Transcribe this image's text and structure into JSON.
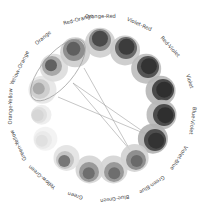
{
  "diagram": {
    "center": [
      102,
      108
    ],
    "label_radius": 90,
    "nodes": [
      {
        "label": "Orange-Red",
        "x": 100,
        "y": 40,
        "r_outer": 15,
        "r_mid": 11,
        "r_inner": 8,
        "outer": "#cfcfcf",
        "mid": "#8a8a8a",
        "inner": "#4a4a4a",
        "angle": -91
      },
      {
        "label": "Violet-Red",
        "x": 126,
        "y": 48,
        "r_outer": 15,
        "r_mid": 11,
        "r_inner": 8,
        "outer": "#c9c9c9",
        "mid": "#6a6a6a",
        "inner": "#3c3c3c",
        "angle": -66
      },
      {
        "label": "Red-Violet",
        "x": 148,
        "y": 67,
        "r_outer": 15,
        "r_mid": 11,
        "r_inner": 8,
        "outer": "#bdbdbd",
        "mid": "#555555",
        "inner": "#333333",
        "angle": -42
      },
      {
        "label": "Violet",
        "x": 163,
        "y": 90,
        "r_outer": 15,
        "r_mid": 11,
        "r_inner": 8,
        "outer": "#b5b5b5",
        "mid": "#4a4a4a",
        "inner": "#2f2f2f",
        "angle": -17
      },
      {
        "label": "Blue-Violet",
        "x": 164,
        "y": 115,
        "r_outer": 15,
        "r_mid": 11,
        "r_inner": 8,
        "outer": "#b8b8b8",
        "mid": "#4c4c4c",
        "inner": "#2f2f2f",
        "angle": 8
      },
      {
        "label": "Violet-Blue",
        "x": 155,
        "y": 140,
        "r_outer": 15,
        "r_mid": 11,
        "r_inner": 8,
        "outer": "#b0b0b0",
        "mid": "#4d4d4d",
        "inner": "#333333",
        "angle": 33
      },
      {
        "label": "Green-Blue",
        "x": 136,
        "y": 160,
        "r_outer": 14,
        "r_mid": 10,
        "r_inner": 6,
        "outer": "#d2d2d2",
        "mid": "#8f8f8f",
        "inner": "#6a6a6a",
        "angle": 57
      },
      {
        "label": "Blue-Green",
        "x": 114,
        "y": 172,
        "r_outer": 14,
        "r_mid": 10,
        "r_inner": 6,
        "outer": "#d4d4d4",
        "mid": "#999999",
        "inner": "#6e6e6e",
        "angle": 82
      },
      {
        "label": "Green",
        "x": 89,
        "y": 172,
        "r_outer": 14,
        "r_mid": 10,
        "r_inner": 6,
        "outer": "#d4d4d4",
        "mid": "#9a9a9a",
        "inner": "#6e6e6e",
        "angle": 107
      },
      {
        "label": "Yellow-Green",
        "x": 65,
        "y": 160,
        "r_outer": 13,
        "r_mid": 9,
        "r_inner": 6,
        "outer": "#e2e2e2",
        "mid": "#c4c4c4",
        "inner": "#777777",
        "angle": 131
      },
      {
        "label": "Green-Yellow",
        "x": 43,
        "y": 140,
        "r_outer": 12,
        "r_mid": 9,
        "r_inner": 6,
        "outer": "#f2f2f2",
        "mid": "#eaeaea",
        "inner": "#e0e0e0",
        "angle": 156
      },
      {
        "label": "Orange-Yellow",
        "x": 39,
        "y": 115,
        "r_outer": 10,
        "r_mid": 8,
        "r_inner": 6,
        "outer": "#ececec",
        "mid": "#e0e0e0",
        "inner": "#d6d6d6",
        "angle": 181
      },
      {
        "label": "Yellow-Orange",
        "x": 40,
        "y": 89,
        "r_outer": 14,
        "r_mid": 10,
        "r_inner": 6,
        "outer": "#e6e6e6",
        "mid": "#cfcfcf",
        "inner": "#a9a9a9",
        "angle": 206
      },
      {
        "label": "Orange",
        "x": 52,
        "y": 66,
        "r_outer": 14,
        "r_mid": 10,
        "r_inner": 6,
        "outer": "#dcdcdc",
        "mid": "#a8a8a8",
        "inner": "#616161",
        "angle": 230
      },
      {
        "label": "Red-Orange",
        "x": 74,
        "y": 50,
        "r_outer": 15,
        "r_mid": 11,
        "r_inner": 7,
        "outer": "#cdcdcd",
        "mid": "#8f8f8f",
        "inner": "#5f5f5f",
        "angle": 255
      }
    ],
    "highlight_ellipse": {
      "cx": 58,
      "cy": 70,
      "rx": 16,
      "ry": 38,
      "rotate": 40,
      "stroke": "#9a9a9a"
    },
    "links": [
      {
        "x1": 73,
        "y1": 83,
        "x2": 148,
        "y2": 135
      },
      {
        "x1": 58,
        "y1": 97,
        "x2": 148,
        "y2": 135
      },
      {
        "x1": 73,
        "y1": 83,
        "x2": 130,
        "y2": 150
      },
      {
        "x1": 84,
        "y1": 68,
        "x2": 130,
        "y2": 150
      }
    ],
    "line_color": "#a0a0a0"
  }
}
